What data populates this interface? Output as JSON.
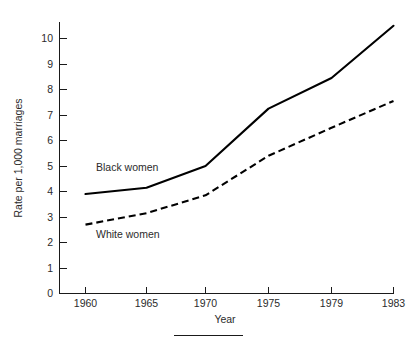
{
  "chart_data": {
    "type": "line",
    "title": "",
    "xlabel": "Year",
    "ylabel": "Rate per 1,000 marriages",
    "x": [
      1960,
      1965,
      1970,
      1975,
      1979,
      1983
    ],
    "xtick_labels": [
      "1960",
      "1965",
      "1970",
      "1975",
      "1979",
      "1983"
    ],
    "ytick_labels": [
      "0",
      "1",
      "2",
      "3",
      "4",
      "5",
      "6",
      "7",
      "8",
      "9",
      "10"
    ],
    "yticks": [
      0,
      1,
      2,
      3,
      4,
      5,
      6,
      7,
      8,
      9,
      10
    ],
    "ylim": [
      0,
      10.7
    ],
    "grid": false,
    "legend_position": "inline-annotation",
    "series": [
      {
        "name": "Black women",
        "style": "solid",
        "color": "#000000",
        "values": [
          3.9,
          4.15,
          5.0,
          7.25,
          8.45,
          10.5
        ]
      },
      {
        "name": "White women",
        "style": "dashed",
        "color": "#000000",
        "values": [
          2.7,
          3.15,
          3.85,
          5.4,
          6.5,
          7.55
        ]
      }
    ],
    "annotations": [
      {
        "text": "Black women",
        "x_px": 96,
        "y_px": 171
      },
      {
        "text": "White women",
        "x_px": 96,
        "y_px": 238
      }
    ]
  },
  "axes": {
    "y_axis_title": "Rate per 1,000 marriages",
    "x_axis_title": "Year"
  },
  "footer": {
    "rule": true
  }
}
